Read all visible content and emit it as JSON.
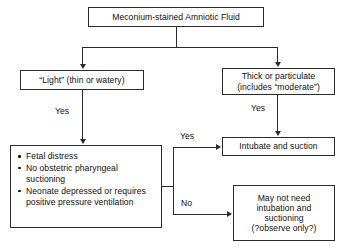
{
  "diagram": {
    "type": "flowchart",
    "background_color": "#ffffff",
    "line_color": "#2b2b2b",
    "text_color": "#101010"
  },
  "nodes": {
    "root": {
      "id": "root",
      "label": "Meconium-stained Amniotic Fluid",
      "shape": "rectangle"
    },
    "light": {
      "id": "light",
      "label": "“Light” (thin or watery)",
      "shape": "rectangle"
    },
    "thick": {
      "id": "thick",
      "line1": "Thick or particulate",
      "line2": "(includes “moderate”)",
      "shape": "rectangle"
    },
    "criteria": {
      "id": "criteria",
      "shape": "rectangle",
      "bullets": [
        "Fetal distress",
        "No obstetric pharyngeal suctioning",
        "Neonate depressed or requires positive pressure ventilation"
      ]
    },
    "intubate": {
      "id": "intubate",
      "label": "Intubate and suction",
      "shape": "rectangle"
    },
    "maynot": {
      "id": "maynot",
      "shape": "rectangle",
      "line1": "May not need",
      "line2": "intubation and",
      "line3": "suctioning",
      "line4": "(?observe only?)"
    }
  },
  "edge_labels": {
    "light_yes": "Yes",
    "thick_yes": "Yes",
    "criteria_yes": "Yes",
    "criteria_no": "No"
  }
}
